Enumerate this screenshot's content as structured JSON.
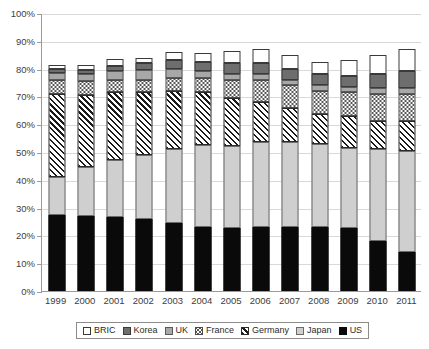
{
  "chart_data": {
    "type": "bar",
    "subtype": "stacked-bar-percent",
    "title": "",
    "xlabel": "",
    "ylabel": "",
    "ylim": [
      0,
      100
    ],
    "ytick_labels": [
      "0%",
      "10%",
      "20%",
      "30%",
      "40%",
      "50%",
      "60%",
      "70%",
      "80%",
      "90%",
      "100%"
    ],
    "ytick_values": [
      0,
      10,
      20,
      30,
      40,
      50,
      60,
      70,
      80,
      90,
      100
    ],
    "grid": true,
    "legend_position": "bottom",
    "categories": [
      "1999",
      "2000",
      "2001",
      "2002",
      "2003",
      "2004",
      "2005",
      "2006",
      "2007",
      "2008",
      "2009",
      "2010",
      "2011"
    ],
    "stack_order_bottom_to_top": [
      "US",
      "Japan",
      "Germany",
      "France",
      "UK",
      "Korea",
      "BRIC"
    ],
    "series": [
      {
        "name": "US",
        "pattern": "solid-black",
        "color": "#0a0a0a",
        "values": [
          27.5,
          27.0,
          26.5,
          26.0,
          24.5,
          23.0,
          22.5,
          23.0,
          23.0,
          23.0,
          22.5,
          18.0,
          14.0
        ]
      },
      {
        "name": "Japan",
        "pattern": "solid-light-gray",
        "color": "#cfcfcf",
        "values": [
          13.5,
          17.5,
          20.5,
          23.0,
          26.5,
          29.5,
          29.5,
          30.5,
          30.5,
          30.0,
          29.0,
          33.0,
          36.5
        ]
      },
      {
        "name": "Germany",
        "pattern": "diagonal-hatch",
        "color": "#1a1a1a",
        "values": [
          30.0,
          26.0,
          24.5,
          22.5,
          21.0,
          19.0,
          17.5,
          14.5,
          12.5,
          10.5,
          11.5,
          10.0,
          10.5
        ]
      },
      {
        "name": "France",
        "pattern": "dotted",
        "color": "#4a4a4a",
        "values": [
          5.0,
          5.0,
          4.5,
          4.5,
          4.5,
          5.0,
          6.5,
          8.0,
          8.0,
          8.5,
          8.5,
          10.0,
          10.0
        ]
      },
      {
        "name": "UK",
        "pattern": "solid-medium-gray",
        "color": "#a8a8a8",
        "values": [
          2.5,
          2.5,
          3.0,
          3.5,
          3.5,
          2.5,
          2.0,
          2.0,
          2.0,
          2.0,
          2.0,
          2.0,
          2.0
        ]
      },
      {
        "name": "Korea",
        "pattern": "solid-dark-gray",
        "color": "#6e6e6e",
        "values": [
          1.5,
          1.5,
          2.0,
          2.5,
          3.0,
          3.5,
          4.0,
          4.0,
          4.0,
          4.0,
          4.0,
          5.0,
          6.0
        ]
      },
      {
        "name": "BRIC",
        "pattern": "white-empty",
        "color": "#ffffff",
        "values": [
          1.5,
          2.0,
          2.5,
          2.0,
          3.0,
          3.0,
          4.5,
          5.0,
          5.0,
          4.5,
          5.5,
          7.0,
          8.0
        ]
      }
    ],
    "totals": [
      81.5,
      81.5,
      83.5,
      84.0,
      86.0,
      85.5,
      86.5,
      87.0,
      85.0,
      82.5,
      83.0,
      85.0,
      87.0
    ]
  },
  "legend": {
    "items": [
      {
        "label": "BRIC",
        "swatch": "white-empty-swatch"
      },
      {
        "label": "Korea",
        "swatch": "dark-gray-swatch"
      },
      {
        "label": "UK",
        "swatch": "medium-gray-swatch"
      },
      {
        "label": "France",
        "swatch": "dotted-swatch"
      },
      {
        "label": "Germany",
        "swatch": "diagonal-hatch-swatch"
      },
      {
        "label": "Japan",
        "swatch": "light-gray-swatch"
      },
      {
        "label": "US",
        "swatch": "solid-black-swatch"
      }
    ]
  }
}
